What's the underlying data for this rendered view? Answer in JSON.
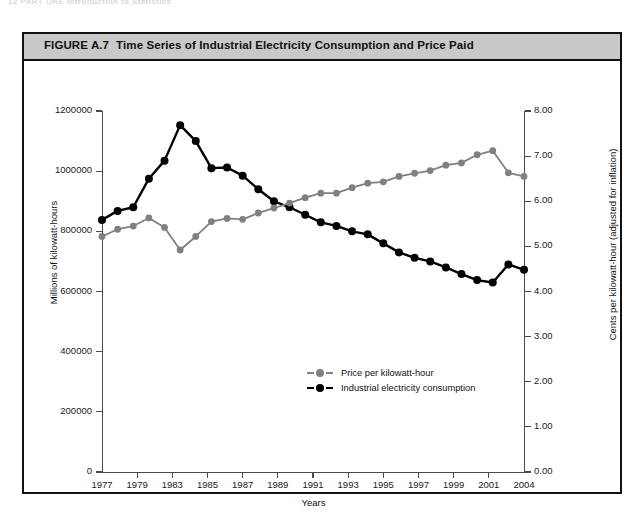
{
  "page_header": "12  PART ONE  Introduction to Statistics",
  "figure": {
    "number": "FIGURE A.7",
    "title": "Time Series of Industrial Electricity Consumption and Price Paid"
  },
  "legend": {
    "position": "inside-center-lower",
    "items": [
      {
        "label": "Price per kilowatt-hour",
        "color": "#808080",
        "marker": "filled-circle"
      },
      {
        "label": "Industrial electricity consumption",
        "color": "#000000",
        "marker": "filled-circle"
      }
    ]
  },
  "chart_data": {
    "type": "line",
    "title": "Time Series of Industrial Electricity Consumption and Price Paid",
    "xlabel": "Years",
    "grid": false,
    "x": [
      1977,
      1978,
      1979,
      1980,
      1981,
      1982,
      1983,
      1984,
      1985,
      1986,
      1987,
      1988,
      1989,
      1990,
      1991,
      1992,
      1993,
      1994,
      1995,
      1996,
      1997,
      1998,
      1999,
      2000,
      2001,
      2002,
      2003,
      2004
    ],
    "xticks": [
      1977,
      1979,
      1981,
      1985,
      1987,
      1989,
      1991,
      1993,
      1995,
      1997,
      1999,
      2001,
      2004
    ],
    "xtick_labels": [
      "1977",
      "1979",
      "1983",
      "1985",
      "1987",
      "1989",
      "1991",
      "1993",
      "1995",
      "1997",
      "1999",
      "2001",
      "2004"
    ],
    "xlim": [
      1977,
      2004
    ],
    "axes": [
      {
        "side": "left",
        "ylabel": "Millions of kilowatt-hours",
        "ylim": [
          0,
          1200000
        ],
        "yticks": [
          0,
          200000,
          400000,
          600000,
          800000,
          1000000,
          1200000
        ],
        "ytick_labels": [
          "0",
          "200000",
          "400000",
          "600000",
          "800000",
          "1000000",
          "1200000"
        ]
      },
      {
        "side": "right",
        "ylabel": "Cents per kilowatt-hour (adjusted for inflation)",
        "ylim": [
          0,
          8
        ],
        "yticks": [
          0,
          1,
          2,
          3,
          4,
          5,
          6,
          7,
          8
        ],
        "ytick_labels": [
          "0.00",
          "1.00",
          "2.00",
          "3.00",
          "4.00",
          "5.00",
          "6.00",
          "7.00",
          "8.00"
        ]
      }
    ],
    "series": [
      {
        "name": "Industrial electricity consumption",
        "axis": "left",
        "color": "#000000",
        "marker": "filled-circle",
        "values": [
          838000,
          868000,
          880000,
          975000,
          1035000,
          1153000,
          1100000,
          1010000,
          1012000,
          985000,
          940000,
          900000,
          880000,
          855000,
          830000,
          818000,
          800000,
          790000,
          760000,
          730000,
          712000,
          700000,
          680000,
          658000,
          638000,
          630000,
          690000,
          672000
        ]
      },
      {
        "name": "Price per kilowatt-hour",
        "axis": "right",
        "color": "#808080",
        "marker": "filled-circle",
        "values": [
          5.22,
          5.38,
          5.45,
          5.63,
          5.42,
          4.92,
          5.22,
          5.55,
          5.62,
          5.6,
          5.74,
          5.85,
          5.96,
          6.08,
          6.18,
          6.18,
          6.3,
          6.4,
          6.43,
          6.55,
          6.62,
          6.68,
          6.8,
          6.85,
          7.03,
          7.12,
          6.63,
          6.55
        ]
      }
    ]
  }
}
